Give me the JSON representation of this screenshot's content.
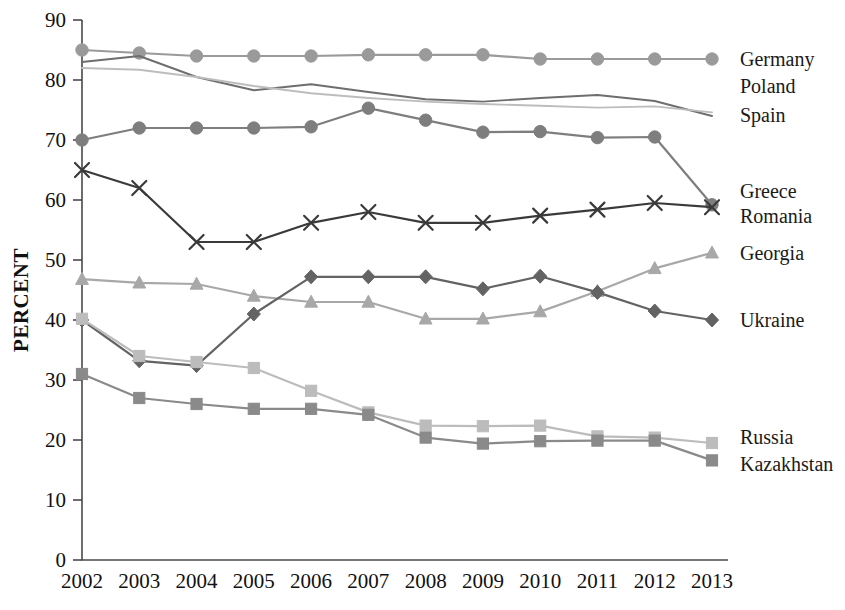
{
  "chart_data": {
    "type": "line",
    "title": "",
    "xlabel": "",
    "ylabel": "PERCENT",
    "ylim": [
      0,
      90
    ],
    "yticks": [
      0,
      10,
      20,
      30,
      40,
      50,
      60,
      70,
      80,
      90
    ],
    "grid": false,
    "legend_position": "right-inline",
    "categories": [
      "2002",
      "2003",
      "2004",
      "2005",
      "2006",
      "2007",
      "2008",
      "2009",
      "2010",
      "2011",
      "2012",
      "2013"
    ],
    "series": [
      {
        "name": "Germany",
        "marker": "circle",
        "color": "#9a9a9a",
        "values": [
          85.0,
          84.5,
          84.0,
          84.0,
          84.0,
          84.2,
          84.2,
          84.2,
          83.5,
          83.5,
          83.5,
          83.5
        ]
      },
      {
        "name": "Poland",
        "marker": "none",
        "color": "#6e6e6e",
        "values": [
          83.0,
          84.0,
          80.5,
          78.3,
          79.3,
          78.0,
          76.8,
          76.4,
          77.0,
          77.5,
          76.5,
          74.0
        ]
      },
      {
        "name": "Spain",
        "marker": "none",
        "color": "#bdbdbd",
        "values": [
          82.0,
          81.7,
          80.5,
          79.0,
          77.8,
          77.0,
          76.4,
          76.0,
          75.7,
          75.4,
          75.6,
          74.6
        ]
      },
      {
        "name": "Greece",
        "marker": "circle",
        "color": "#7e7e7e",
        "values": [
          70.0,
          72.0,
          72.0,
          72.0,
          72.2,
          75.3,
          73.3,
          71.3,
          71.4,
          70.4,
          70.5,
          59.2
        ]
      },
      {
        "name": "Romania",
        "marker": "cross",
        "color": "#3a3a3a",
        "values": [
          65.0,
          62.0,
          53.0,
          53.0,
          56.2,
          58.0,
          56.2,
          56.2,
          57.4,
          58.4,
          59.5,
          58.8
        ]
      },
      {
        "name": "Georgia",
        "marker": "triangle",
        "color": "#a8a8a8",
        "values": [
          46.8,
          46.2,
          46.0,
          44.0,
          43.0,
          43.0,
          40.2,
          40.2,
          41.4,
          44.8,
          48.6,
          51.2
        ]
      },
      {
        "name": "Ukraine",
        "marker": "diamond",
        "color": "#636363",
        "values": [
          40.0,
          33.2,
          32.4,
          41.0,
          47.2,
          47.2,
          47.2,
          45.2,
          47.3,
          44.6,
          41.5,
          40.0
        ]
      },
      {
        "name": "Russia",
        "marker": "square",
        "color": "#bcbcbc",
        "values": [
          40.2,
          34.0,
          33.0,
          32.0,
          28.2,
          24.6,
          22.4,
          22.3,
          22.4,
          20.6,
          20.4,
          19.5
        ]
      },
      {
        "name": "Kazakhstan",
        "marker": "square",
        "color": "#8a8a8a",
        "values": [
          31.0,
          27.0,
          26.0,
          25.2,
          25.2,
          24.2,
          20.4,
          19.4,
          19.8,
          19.9,
          19.9,
          16.6
        ]
      }
    ],
    "legend_labels": [
      {
        "text": "Germany"
      },
      {
        "text": "Poland"
      },
      {
        "text": "Spain"
      },
      {
        "text": "Greece"
      },
      {
        "text": "Romania"
      },
      {
        "text": "Georgia"
      },
      {
        "text": "Ukraine"
      },
      {
        "text": "Russia"
      },
      {
        "text": "Kazakhstan"
      }
    ]
  }
}
